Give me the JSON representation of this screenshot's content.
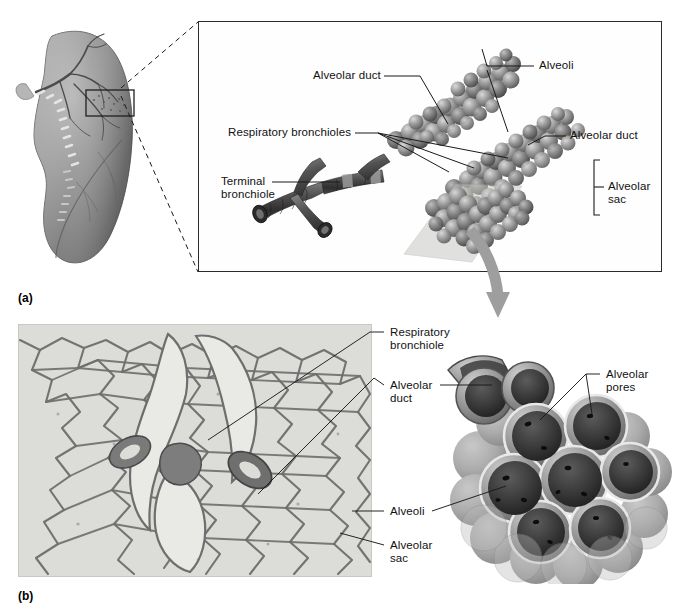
{
  "figure": {
    "panel_a_letter": "(a)",
    "panel_b_letter": "(b)"
  },
  "panel_a": {
    "labels": {
      "alveolar_duct_left": "Alveolar duct",
      "alveoli": "Alveoli",
      "respiratory_bronchioles": "Respiratory bronchioles",
      "alveolar_duct_right": "Alveolar duct",
      "terminal_bronchiole_line1": "Terminal",
      "terminal_bronchiole_line2": "bronchiole",
      "alveolar_sac_line1": "Alveolar",
      "alveolar_sac_line2": "sac"
    }
  },
  "panel_b": {
    "labels": {
      "respiratory_bronchiole_line1": "Respiratory",
      "respiratory_bronchiole_line2": "bronchiole",
      "alveolar_duct_line1": "Alveolar",
      "alveolar_duct_line2": "duct",
      "alveoli": "Alveoli",
      "alveolar_sac_line1": "Alveolar",
      "alveolar_sac_line2": "sac",
      "alveolar_pores_line1": "Alveolar",
      "alveolar_pores_line2": "pores"
    }
  },
  "colors": {
    "background": "#ffffff",
    "text": "#111111",
    "frame_stroke": "#2b2b2b",
    "leader_stroke": "#1a1a1a",
    "lung_tissue": "#8e8e8e",
    "histology_bg": "#d9d9d6",
    "histology_tissue": "#6b6b6b",
    "alveoli_light": "#b8b8b8",
    "alveoli_dark": "#3a3a3a",
    "bronchiole_dark": "#4a4a4a",
    "arrow_gray": "#9a9a9a"
  }
}
